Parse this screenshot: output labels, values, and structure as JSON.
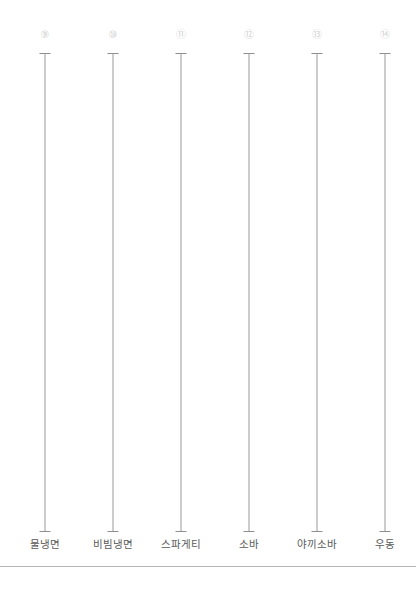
{
  "chart_data": {
    "type": "bar",
    "subtype": "error-bar-whisker",
    "title": "",
    "subtitle": "",
    "xlabel": "",
    "ylabel": "",
    "grid": false,
    "legend": null,
    "orientation": "vertical",
    "categories": [
      "물냉면",
      "비빔냉면",
      "스파게티",
      "소바",
      "야끼소바",
      "우동"
    ],
    "point_labels": [
      "⑨",
      "⑩",
      "⑪",
      "⑫",
      "⑬",
      "⑭"
    ],
    "series": [
      {
        "name": "range",
        "values": [
          1,
          1,
          1,
          1,
          1,
          1
        ],
        "lower": [
          0,
          0,
          0,
          0,
          0,
          0
        ],
        "upper": [
          1,
          1,
          1,
          1,
          1,
          1
        ]
      }
    ],
    "items": [
      {
        "index_label": "⑨",
        "category": "물냉면",
        "x_px": 45,
        "whisker_top_px": 53,
        "whisker_bottom_px": 531
      },
      {
        "index_label": "⑩",
        "category": "비빔냉면",
        "x_px": 113,
        "whisker_top_px": 53,
        "whisker_bottom_px": 531
      },
      {
        "index_label": "⑪",
        "category": "스파게티",
        "x_px": 181,
        "whisker_top_px": 53,
        "whisker_bottom_px": 531
      },
      {
        "index_label": "⑫",
        "category": "소바",
        "x_px": 249,
        "whisker_top_px": 53,
        "whisker_bottom_px": 531
      },
      {
        "index_label": "⑬",
        "category": "야끼소바",
        "x_px": 317,
        "whisker_top_px": 53,
        "whisker_bottom_px": 531
      },
      {
        "index_label": "⑭",
        "category": "우동",
        "x_px": 385,
        "whisker_top_px": 53,
        "whisker_bottom_px": 531
      }
    ]
  },
  "colors": {
    "background": "#ffffff",
    "whisker": "#9a9a9a",
    "whisker_cap": "#8e8e8e",
    "index_marker": "#cfcfcf",
    "category_label": "#595959",
    "divider": "#b5b5b5"
  },
  "layout": {
    "label_row_y_px": 537,
    "divider_y_px": 566,
    "canvas_width_px": 416,
    "canvas_height_px": 589
  }
}
